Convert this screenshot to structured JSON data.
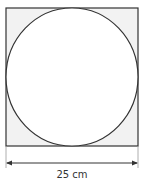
{
  "diagram": {
    "shape": "circle inscribed in square",
    "square": {
      "fill": "#f2f2f2",
      "stroke": "#333333"
    },
    "circle": {
      "fill": "#ffffff",
      "stroke": "#333333"
    },
    "dimension": {
      "label": "25 cm",
      "orientation": "horizontal"
    }
  }
}
